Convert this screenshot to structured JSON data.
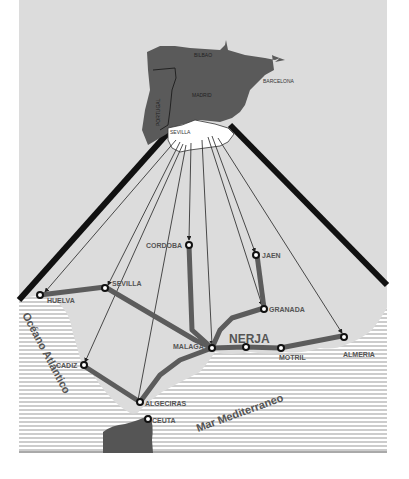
{
  "colors": {
    "land_bg": "#dcdcdc",
    "iberia": "#5a5a5a",
    "andalusia": "#ffffff",
    "route": "#5c5c5c",
    "sea_lines": "#9a9a9a",
    "beam": "#111111",
    "label": "#555555"
  },
  "iberia_labels": {
    "bilbao": "BILBAO",
    "madrid": "MADRID",
    "barcelona": "BARCELONA",
    "portugal": "PORTUGAL",
    "sevilla": "SEVILLA"
  },
  "cities": {
    "huelva": "HUELVA",
    "sevilla": "SEVILLA",
    "cordoba": "CORDOBA",
    "jaen": "JAEN",
    "granada": "GRANADA",
    "malaga": "MALAGA",
    "nerja": "NERJA",
    "motril": "MOTRIL",
    "almeria": "ALMERIA",
    "cadiz": "CADIZ",
    "algeciras": "ALGECIRAS",
    "ceuta": "CEUTA"
  },
  "seas": {
    "atlantic": "Océano Atlántico",
    "mediterranean": "Mar Mediterraneo"
  }
}
